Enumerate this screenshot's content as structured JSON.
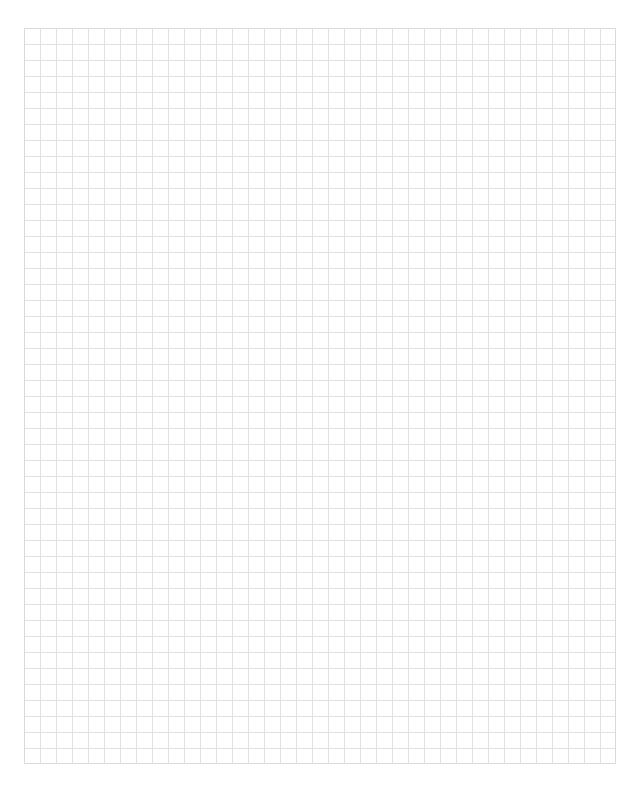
{
  "page": {
    "type": "graph-paper",
    "grid": {
      "columns": 37,
      "rows": 46,
      "cell_size_px": 16,
      "line_color": "#e1e1e1",
      "border_color": "#d9d9d9",
      "background": "#ffffff"
    }
  }
}
